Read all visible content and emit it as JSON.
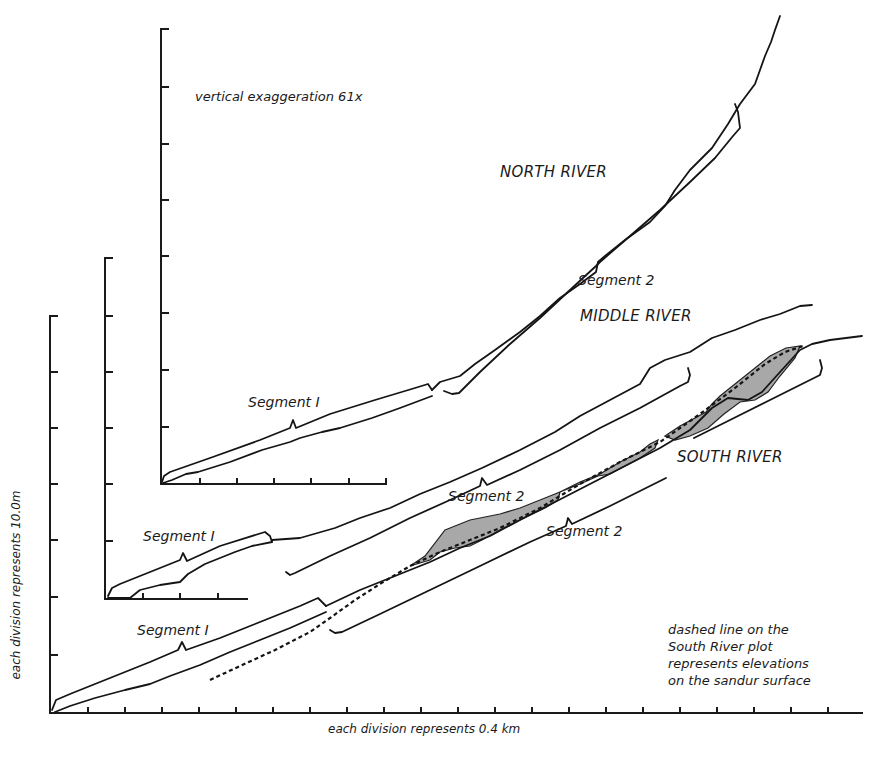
{
  "figure": {
    "annotations": {
      "vertical_exaggeration": "vertical exaggeration 61x",
      "x_axis_label": "each division represents 0.4 km",
      "y_axis_label": "each division represents 10.0m",
      "note_lines": [
        "dashed line on the",
        "South River plot",
        "represents elevations",
        "on the sandur surface"
      ]
    },
    "rivers": {
      "north": {
        "name": "NORTH RIVER",
        "segment_1": "Segment I",
        "segment_2": "Segment 2"
      },
      "middle": {
        "name": "MIDDLE RIVER",
        "segment_1": "Segment I",
        "segment_2": "Segment 2"
      },
      "south": {
        "name": "SOUTH RIVER",
        "segment_1": "Segment I",
        "segment_2": "Segment 2"
      }
    },
    "colors": {
      "line": "#141414",
      "shading": "#a8a8a8",
      "background": "#ffffff"
    }
  }
}
